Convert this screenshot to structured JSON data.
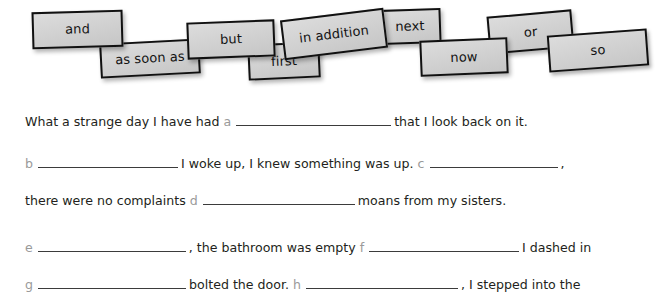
{
  "worksheet": {
    "tile_bank": {
      "name": "connective-word-tiles",
      "tiles": [
        {
          "label": "and",
          "x": 32,
          "y": 11,
          "w": 91,
          "h": 37,
          "rot": -1.6
        },
        {
          "label": "as soon as",
          "x": 100,
          "y": 41,
          "w": 100,
          "h": 35,
          "rot": -3.0
        },
        {
          "label": "but",
          "x": 187,
          "y": 21,
          "w": 88,
          "h": 37,
          "rot": -2.2
        },
        {
          "label": "first",
          "x": 248,
          "y": 43,
          "w": 72,
          "h": 36,
          "rot": -2.6
        },
        {
          "label": "in addition",
          "x": 282,
          "y": 14,
          "w": 104,
          "h": 40,
          "rot": -7.0
        },
        {
          "label": "next",
          "x": 379,
          "y": 9,
          "w": 62,
          "h": 35,
          "rot": -2.0
        },
        {
          "label": "now",
          "x": 420,
          "y": 39,
          "w": 88,
          "h": 36,
          "rot": -2.4
        },
        {
          "label": "or",
          "x": 488,
          "y": 13,
          "w": 85,
          "h": 38,
          "rot": -5.0
        },
        {
          "label": "so",
          "x": 548,
          "y": 32,
          "w": 100,
          "h": 37,
          "rot": -4.2
        }
      ]
    },
    "lines": [
      {
        "name": "sentence-line-1",
        "top": 14,
        "parts": [
          {
            "type": "text",
            "value": "What a strange day I have had"
          },
          {
            "type": "blank",
            "letter": "a",
            "width": 155
          },
          {
            "type": "text",
            "value": "that I look back on it."
          }
        ]
      },
      {
        "name": "sentence-line-2",
        "top": 56,
        "parts": [
          {
            "type": "blank",
            "letter": "b",
            "width": 140
          },
          {
            "type": "text",
            "value": "I woke up, I knew something was up."
          },
          {
            "type": "blank",
            "letter": "c",
            "width": 128
          },
          {
            "type": "text",
            "value": ","
          }
        ]
      },
      {
        "name": "sentence-line-3",
        "top": 93,
        "parts": [
          {
            "type": "text",
            "value": "there were no complaints"
          },
          {
            "type": "blank",
            "letter": "d",
            "width": 152
          },
          {
            "type": "text",
            "value": "moans from my sisters."
          }
        ]
      },
      {
        "name": "sentence-line-4",
        "top": 140,
        "parts": [
          {
            "type": "blank",
            "letter": "e",
            "width": 148
          },
          {
            "type": "text",
            "value": ", the bathroom was empty"
          },
          {
            "type": "blank",
            "letter": "f",
            "width": 150
          },
          {
            "type": "text",
            "value": "I dashed in"
          }
        ]
      },
      {
        "name": "sentence-line-5",
        "top": 177,
        "parts": [
          {
            "type": "blank",
            "letter": "g",
            "width": 148
          },
          {
            "type": "text",
            "value": "bolted the door."
          },
          {
            "type": "blank",
            "letter": "h",
            "width": 152
          },
          {
            "type": "text",
            "value": ", I stepped into the"
          }
        ]
      }
    ]
  },
  "colors": {
    "tile_fill": "#d2d2d2",
    "tile_border": "#111111",
    "body_text": "#231f20",
    "blank_letter": "#9a9a9a",
    "rule_line": "#3b3b3b",
    "page_background": "#ffffff"
  }
}
